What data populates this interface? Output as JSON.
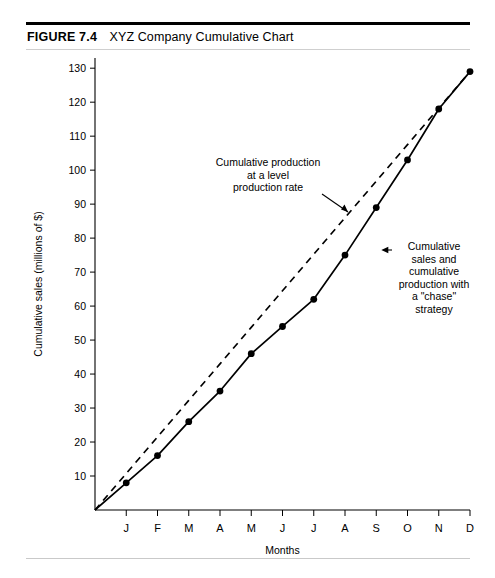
{
  "figure": {
    "number": "FIGURE 7.4",
    "title": "XYZ Company Cumulative Chart"
  },
  "chart_data": {
    "type": "line",
    "title": "XYZ Company Cumulative Chart",
    "xlabel": "Months",
    "ylabel": "Cumulative sales (millions of $)",
    "categories": [
      "J",
      "F",
      "M",
      "A",
      "M",
      "J",
      "J",
      "A",
      "S",
      "O",
      "N",
      "D"
    ],
    "xtick_labels": [
      "J",
      "F",
      "M",
      "A",
      "M",
      "J",
      "J",
      "A",
      "S",
      "O",
      "N",
      "D"
    ],
    "ytick_labels": [
      "10",
      "20",
      "30",
      "40",
      "50",
      "60",
      "70",
      "80",
      "90",
      "100",
      "110",
      "120",
      "130"
    ],
    "yticks": [
      10,
      20,
      30,
      40,
      50,
      60,
      70,
      80,
      90,
      100,
      110,
      120,
      130
    ],
    "ylim": [
      0,
      133
    ],
    "xlim": [
      0,
      12.6
    ],
    "grid": false,
    "legend": "none",
    "origin_value": 0,
    "series": [
      {
        "name": "Cumulative sales and cumulative production with a \"chase\" strategy",
        "style": "solid",
        "markers": true,
        "values": [
          8,
          16,
          26,
          35,
          46,
          54,
          62,
          75,
          89,
          103,
          118,
          129
        ]
      },
      {
        "name": "Cumulative production at a level production rate",
        "style": "dashed",
        "markers": false,
        "values": [
          10.75,
          21.5,
          32.25,
          43,
          53.75,
          64.5,
          75.25,
          86,
          96.75,
          107.5,
          118.25,
          129
        ]
      }
    ],
    "annotations": [
      {
        "id": "level-production-annotation",
        "lines": [
          "Cumulative production",
          "at a level",
          "production rate"
        ],
        "points_to_series": "Cumulative production at a level production rate"
      },
      {
        "id": "chase-strategy-annotation",
        "lines": [
          "Cumulative",
          "sales and",
          "cumulative",
          "production with",
          "a \"chase\"",
          "strategy"
        ],
        "points_to_series": "Cumulative sales and cumulative production with a \"chase\" strategy"
      }
    ]
  }
}
